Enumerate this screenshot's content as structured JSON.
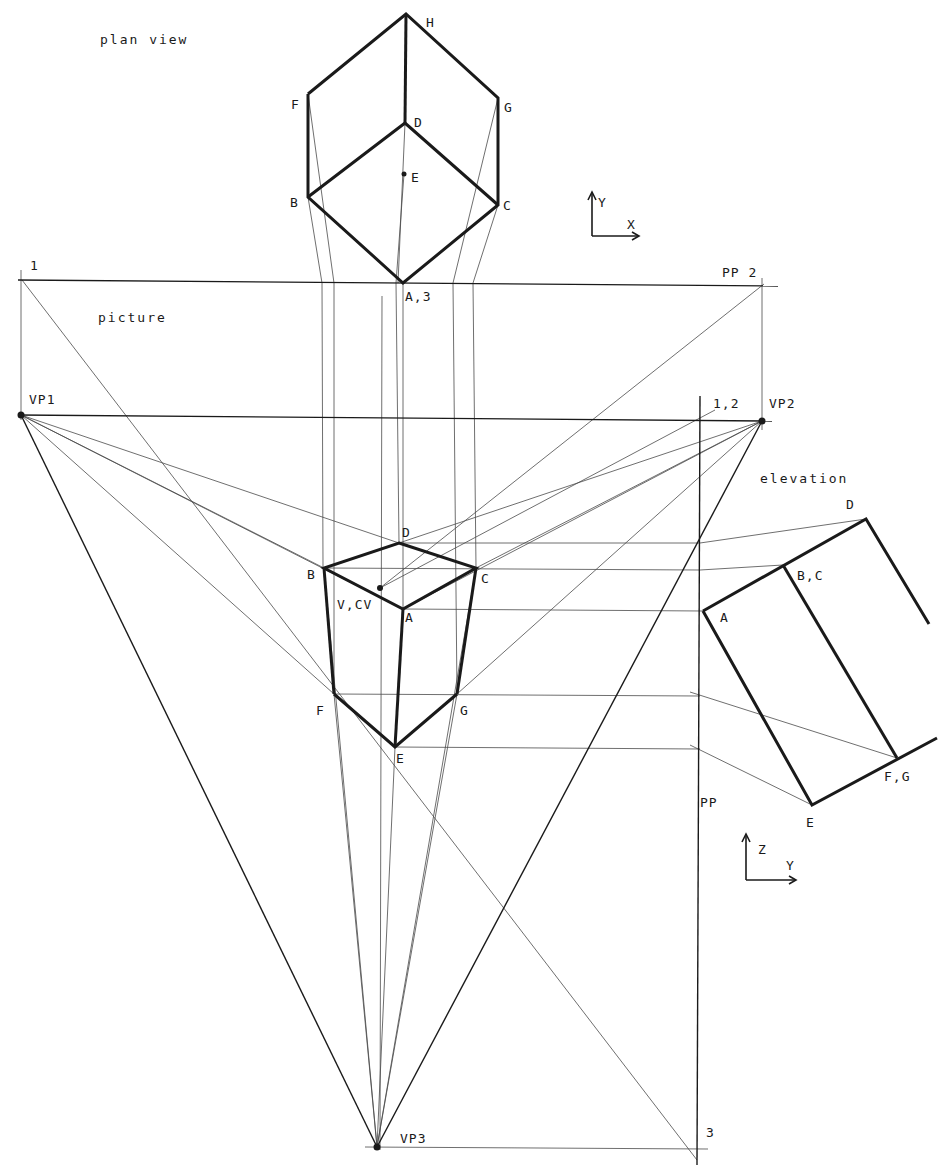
{
  "colors": {
    "ink": "#1a1a1a",
    "construction": "#4a4a4a",
    "paper": "#ffffff"
  },
  "captions": {
    "plan_view": "plan view",
    "picture": "picture",
    "elevation": "elevation"
  },
  "axes": {
    "plan": {
      "y_label": "Y",
      "x_label": "X"
    },
    "elevation": {
      "z_label": "Z",
      "y_label": "Y"
    }
  },
  "plan_view": {
    "labels": {
      "H": "H",
      "F": "F",
      "G": "G",
      "D": "D",
      "E": "E",
      "B": "B",
      "C": "C",
      "A3": "A,3"
    },
    "points": {
      "H": [
        406,
        14
      ],
      "F": [
        308,
        94
      ],
      "G": [
        498,
        98
      ],
      "D": [
        405,
        123
      ],
      "E": [
        404,
        174
      ],
      "B": [
        308,
        197
      ],
      "C": [
        498,
        205
      ],
      "A": [
        403,
        283
      ]
    }
  },
  "picture_plane": {
    "pp_line_label": "PP 2",
    "left_mark_label": "1",
    "horizon_label_vp1": "VP1",
    "horizon_label_vp2": "VP2",
    "mark_12_label": "1,2",
    "pp_vertical_label": "PP",
    "vp3_label": "VP3",
    "mark_3_label": "3",
    "VP1": [
      21,
      415
    ],
    "VP2": [
      762,
      421
    ],
    "VP3": [
      377,
      1147
    ]
  },
  "perspective": {
    "labels": {
      "D": "D",
      "B": "B",
      "C": "C",
      "VCV": "V,CV",
      "A": "A",
      "F": "F",
      "G": "G",
      "E": "E"
    },
    "points": {
      "D": [
        399,
        543
      ],
      "B": [
        324,
        568
      ],
      "C": [
        476,
        568
      ],
      "V": [
        380,
        588
      ],
      "A": [
        403,
        609
      ],
      "F": [
        334,
        694
      ],
      "G": [
        457,
        694
      ],
      "E": [
        395,
        747
      ]
    }
  },
  "elevation": {
    "labels": {
      "D": "D",
      "BC": "B,C",
      "A": "A",
      "FG": "F,G",
      "E": "E"
    },
    "points": {
      "D": [
        866,
        519
      ],
      "BC": [
        783,
        565
      ],
      "A": [
        703,
        611
      ],
      "FG": [
        897,
        758
      ],
      "E": [
        812,
        805
      ],
      "D_end": [
        929,
        624
      ],
      "FG_end": [
        937,
        738
      ]
    }
  }
}
